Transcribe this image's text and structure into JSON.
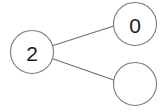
{
  "diagram": {
    "type": "node-link-graph",
    "background_color": "#ffffff",
    "node_stroke_color": "#7a7a7a",
    "node_fill_color": "#ffffff",
    "edge_color": "#6e6e6e",
    "label_color": "#1c1c1c",
    "nodes": [
      {
        "id": "node-left",
        "name": "node-left",
        "label": "2",
        "cx": 32,
        "cy": 52,
        "r": 21.5
      },
      {
        "id": "node-top-right",
        "name": "node-top-right",
        "label": "0",
        "cx": 135,
        "cy": 24,
        "r": 21.5
      },
      {
        "id": "node-bottom-right",
        "name": "node-bottom-right",
        "label": "",
        "cx": 135,
        "cy": 84,
        "r": 21.5
      }
    ],
    "edges": [
      {
        "id": "edge-left-to-top-right",
        "name": "edge-left-to-top-right",
        "from": "node-left",
        "to": "node-top-right",
        "x1": 52.5,
        "y1": 45.8,
        "x2": 114.5,
        "y2": 25.8
      },
      {
        "id": "edge-left-to-bottom-right",
        "name": "edge-left-to-bottom-right",
        "from": "node-left",
        "to": "node-bottom-right",
        "x1": 52.0,
        "y1": 58.5,
        "x2": 115.0,
        "y2": 80.5
      }
    ]
  }
}
